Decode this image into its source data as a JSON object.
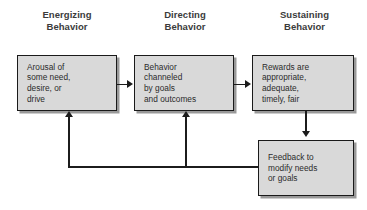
{
  "diagram": {
    "colors": {
      "box_fill": "#d9d9d9",
      "box_border": "#1a1a1a",
      "heading_text": "#3b3b3b",
      "body_text": "#2b2b2b",
      "connector": "#1c1c1c",
      "background": "#ffffff"
    },
    "headings": [
      {
        "id": "energizing",
        "label": "Energizing\nBehavior"
      },
      {
        "id": "directing",
        "label": "Directing\nBehavior"
      },
      {
        "id": "sustaining",
        "label": "Sustaining\nBehavior"
      }
    ],
    "boxes": [
      {
        "id": "arousal",
        "text": "Arousal of\nsome need,\ndesire, or\ndrive"
      },
      {
        "id": "behavior",
        "text": "Behavior\nchanneled\nby goals\nand outcomes"
      },
      {
        "id": "rewards",
        "text": "Rewards are\nappropriate,\nadequate,\ntimely, fair"
      },
      {
        "id": "feedback",
        "text": "Feedback to\nmodify needs\nor goals"
      }
    ],
    "connectors": [
      {
        "id": "arousal-to-behavior",
        "from": "arousal",
        "to": "behavior",
        "direction": "right"
      },
      {
        "id": "behavior-to-rewards",
        "from": "behavior",
        "to": "rewards",
        "direction": "right"
      },
      {
        "id": "rewards-to-feedback",
        "from": "rewards",
        "to": "feedback",
        "direction": "down"
      },
      {
        "id": "feedback-rail",
        "from": "feedback",
        "to": "rail",
        "direction": "left"
      },
      {
        "id": "rail-to-arousal",
        "from": "rail",
        "to": "arousal",
        "direction": "up"
      },
      {
        "id": "rail-to-behavior",
        "from": "rail",
        "to": "behavior",
        "direction": "up"
      }
    ]
  }
}
